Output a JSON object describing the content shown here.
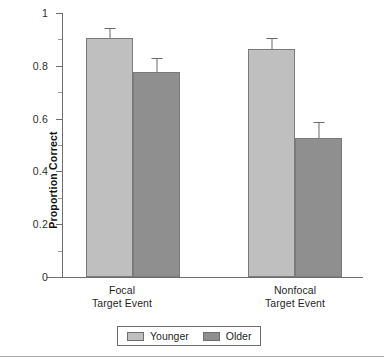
{
  "chart_data": {
    "type": "bar",
    "title": "",
    "xlabel": "",
    "ylabel": "Proportion Correct",
    "ylim": [
      0,
      1
    ],
    "ytick_labels": [
      "1",
      "0.8",
      "0.6",
      "0.4",
      "0.2",
      "0"
    ],
    "ytick_values": [
      1,
      0.8,
      0.6,
      0.4,
      0.2,
      0
    ],
    "yminor_values": [
      0.9,
      0.7,
      0.5,
      0.3,
      0.1
    ],
    "grid": false,
    "legend_position": "bottom-center",
    "categories": [
      "Focal\nTarget Event",
      "Nonfocal\nTarget Event"
    ],
    "category_lines": [
      [
        "Focal",
        "Target Event"
      ],
      [
        "Nonfocal",
        "Target Event"
      ]
    ],
    "series": [
      {
        "name": "Younger",
        "color": "#bfbfbf",
        "values": [
          0.905,
          0.865
        ],
        "errors": [
          0.038,
          0.042
        ]
      },
      {
        "name": "Older",
        "color": "#8f8f8f",
        "values": [
          0.775,
          0.527
        ],
        "errors": [
          0.053,
          0.061
        ]
      }
    ]
  },
  "legend": {
    "entries": [
      {
        "label": "Younger",
        "color": "#bfbfbf"
      },
      {
        "label": "Older",
        "color": "#8f8f8f"
      }
    ]
  },
  "axes": {
    "y_title": "Proportion Correct",
    "tick_0": "0",
    "tick_02": "0.2",
    "tick_04": "0.4",
    "tick_06": "0.6",
    "tick_08": "0.8",
    "tick_1": "1"
  },
  "categories": {
    "focal_line1": "Focal",
    "focal_line2": "Target Event",
    "nonfocal_line1": "Nonfocal",
    "nonfocal_line2": "Target Event"
  },
  "colors": {
    "younger": "#bfbfbf",
    "older": "#8f8f8f",
    "axis": "#6e6e6e",
    "bar_border": "#7a7a7a"
  }
}
